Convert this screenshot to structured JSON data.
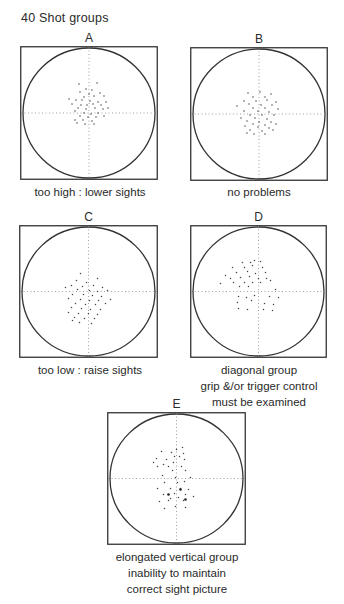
{
  "title": "40 Shot groups",
  "panels": [
    {
      "id": "A",
      "letter": "A",
      "box": [
        20,
        46,
        138,
        134
      ],
      "caption": [
        "too high :  lower sights"
      ],
      "caption_pos": [
        4,
        184,
        172
      ],
      "dots": [
        [
          -10,
          -29
        ],
        [
          8,
          -30
        ],
        [
          -3,
          -24
        ],
        [
          3,
          -23
        ],
        [
          -9,
          -21
        ],
        [
          11,
          -20
        ],
        [
          0,
          -19
        ],
        [
          -5,
          -16
        ],
        [
          5,
          -17
        ],
        [
          15,
          -17
        ],
        [
          -20,
          -14
        ],
        [
          -13,
          -13
        ],
        [
          -7,
          -13
        ],
        [
          1,
          -12
        ],
        [
          9,
          -11
        ],
        [
          17,
          -11
        ],
        [
          -17,
          -9
        ],
        [
          -8,
          -8
        ],
        [
          -2,
          -8
        ],
        [
          4,
          -9
        ],
        [
          12,
          -8
        ],
        [
          -11,
          -5
        ],
        [
          -3,
          -4
        ],
        [
          6,
          -5
        ],
        [
          14,
          -4
        ],
        [
          19,
          -5
        ],
        [
          -14,
          -2
        ],
        [
          -5,
          0
        ],
        [
          2,
          1
        ],
        [
          9,
          0
        ],
        [
          -9,
          3
        ],
        [
          -1,
          4
        ],
        [
          7,
          4
        ],
        [
          15,
          3
        ],
        [
          -14,
          7
        ],
        [
          -6,
          7
        ],
        [
          3,
          8
        ],
        [
          -12,
          10
        ],
        [
          -4,
          11
        ],
        [
          5,
          11
        ]
      ]
    },
    {
      "id": "B",
      "letter": "B",
      "box": [
        190,
        47,
        138,
        134
      ],
      "caption": [
        "no problems"
      ],
      "caption_pos": [
        190,
        184,
        138
      ],
      "dots": [
        [
          -11,
          -21
        ],
        [
          1,
          -22
        ],
        [
          12,
          -20
        ],
        [
          -6,
          -17
        ],
        [
          6,
          -17
        ],
        [
          -15,
          -13
        ],
        [
          -3,
          -13
        ],
        [
          8,
          -14
        ],
        [
          17,
          -12
        ],
        [
          -10,
          -10
        ],
        [
          2,
          -9
        ],
        [
          13,
          -9
        ],
        [
          -22,
          -8
        ],
        [
          -6,
          -6
        ],
        [
          6,
          -6
        ],
        [
          19,
          -5
        ],
        [
          -15,
          -3
        ],
        [
          -1,
          -3
        ],
        [
          10,
          -2
        ],
        [
          -9,
          1
        ],
        [
          3,
          1
        ],
        [
          15,
          1
        ],
        [
          -18,
          4
        ],
        [
          -4,
          4
        ],
        [
          8,
          5
        ],
        [
          -12,
          7
        ],
        [
          0,
          8
        ],
        [
          12,
          8
        ],
        [
          -6,
          10
        ],
        [
          6,
          11
        ],
        [
          17,
          10
        ],
        [
          -14,
          12
        ],
        [
          -1,
          13
        ],
        [
          10,
          14
        ],
        [
          -9,
          16
        ],
        [
          3,
          17
        ],
        [
          14,
          16
        ],
        [
          -5,
          20
        ],
        [
          6,
          20
        ],
        [
          -12,
          19
        ]
      ]
    },
    {
      "id": "C",
      "letter": "C",
      "box": [
        19,
        225,
        139,
        133
      ],
      "caption": [
        "too low :  raise sights"
      ],
      "caption_pos": [
        4,
        362,
        172
      ],
      "dots": [
        [
          -8,
          -18
        ],
        [
          -12,
          -11
        ],
        [
          -2,
          -9
        ],
        [
          9,
          -13
        ],
        [
          -17,
          -6
        ],
        [
          -6,
          -5
        ],
        [
          5,
          -6
        ],
        [
          14,
          -4
        ],
        [
          -23,
          -4
        ],
        [
          -11,
          -2
        ],
        [
          1,
          -1
        ],
        [
          9,
          0
        ],
        [
          19,
          -1
        ],
        [
          -16,
          3
        ],
        [
          -5,
          3
        ],
        [
          4,
          4
        ],
        [
          13,
          5
        ],
        [
          -20,
          7
        ],
        [
          -8,
          8
        ],
        [
          1,
          9
        ],
        [
          10,
          9
        ],
        [
          22,
          8
        ],
        [
          -13,
          12
        ],
        [
          -3,
          13
        ],
        [
          7,
          13
        ],
        [
          17,
          12
        ],
        [
          -17,
          16
        ],
        [
          -7,
          17
        ],
        [
          2,
          18
        ],
        [
          12,
          18
        ],
        [
          -20,
          21
        ],
        [
          -10,
          22
        ],
        [
          0,
          22
        ],
        [
          9,
          23
        ],
        [
          -14,
          26
        ],
        [
          -4,
          27
        ],
        [
          6,
          27
        ],
        [
          -9,
          31
        ],
        [
          3,
          32
        ],
        [
          -16,
          29
        ]
      ]
    },
    {
      "id": "D",
      "letter": "D",
      "box": [
        190,
        225,
        137,
        133
      ],
      "caption": [
        "diagonal group",
        "grip &/or trigger control",
        "must be examined"
      ],
      "caption_pos": [
        183,
        362,
        152
      ],
      "dots": [
        [
          -16,
          -29
        ],
        [
          -8,
          -29
        ],
        [
          -4,
          -31
        ],
        [
          2,
          -30
        ],
        [
          -26,
          -24
        ],
        [
          -14,
          -24
        ],
        [
          -6,
          -26
        ],
        [
          4,
          -24
        ],
        [
          -22,
          -19
        ],
        [
          -11,
          -20
        ],
        [
          -3,
          -18
        ],
        [
          7,
          -19
        ],
        [
          -33,
          -16
        ],
        [
          -28,
          -13
        ],
        [
          -18,
          -14
        ],
        [
          -9,
          -15
        ],
        [
          0,
          -13
        ],
        [
          8,
          -13
        ],
        [
          -25,
          -9
        ],
        [
          -14,
          -9
        ],
        [
          -6,
          -9
        ],
        [
          2,
          -9
        ],
        [
          12,
          -11
        ],
        [
          -38,
          -8
        ],
        [
          -19,
          -5
        ],
        [
          -10,
          -5
        ],
        [
          17,
          -2
        ],
        [
          -20,
          5
        ],
        [
          -12,
          6
        ],
        [
          -4,
          4
        ],
        [
          11,
          5
        ],
        [
          20,
          6
        ],
        [
          -21,
          11
        ],
        [
          -7,
          9
        ],
        [
          6,
          12
        ],
        [
          15,
          13
        ],
        [
          -20,
          17
        ],
        [
          -11,
          18
        ],
        [
          5,
          18
        ],
        [
          14,
          19
        ]
      ]
    },
    {
      "id": "E",
      "letter": "E",
      "box": [
        107,
        412,
        139,
        133
      ],
      "caption": [
        "elongated vertical group",
        "inability to maintain",
        "correct sight picture"
      ],
      "caption_pos": [
        100,
        549,
        154
      ],
      "dots": [
        [
          6,
          -31
        ],
        [
          0,
          -29
        ],
        [
          -15,
          -27
        ],
        [
          -5,
          -26
        ],
        [
          7,
          -25
        ],
        [
          -2,
          -22
        ],
        [
          3,
          -22
        ],
        [
          -20,
          -20
        ],
        [
          -10,
          -19
        ],
        [
          8,
          -19
        ],
        [
          -3,
          -16
        ],
        [
          -23,
          -16
        ],
        [
          -13,
          -14
        ],
        [
          -8,
          -12
        ],
        [
          5,
          -12
        ],
        [
          -19,
          -12
        ],
        [
          -4,
          -8
        ],
        [
          9,
          -8
        ],
        [
          -14,
          -3
        ],
        [
          -1,
          -1
        ],
        [
          14,
          -1
        ],
        [
          -12,
          4
        ],
        [
          1,
          4
        ],
        [
          8,
          3
        ],
        [
          -19,
          10
        ],
        [
          -6,
          10
        ],
        [
          4,
          10
        ],
        [
          12,
          11
        ],
        [
          -13,
          16
        ],
        [
          -2,
          15
        ],
        [
          9,
          16
        ],
        [
          17,
          18
        ],
        [
          -6,
          20
        ],
        [
          2,
          19
        ],
        [
          -17,
          23
        ],
        [
          -8,
          22
        ],
        [
          7,
          22
        ],
        [
          -1,
          28
        ],
        [
          9,
          29
        ],
        [
          -12,
          30
        ]
      ],
      "large_dots": [
        [
          4,
          11
        ],
        [
          -8,
          16
        ],
        [
          9,
          21
        ]
      ]
    }
  ]
}
